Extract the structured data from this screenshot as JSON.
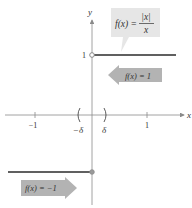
{
  "figure": {
    "function_label": {
      "lhs": "f(x) =",
      "numerator": "|x|",
      "denominator": "x"
    },
    "axes": {
      "x_label": "x",
      "y_label": "y"
    },
    "x_ticks": [
      {
        "label": "−1",
        "value": -1
      },
      {
        "label": "1",
        "value": 1
      }
    ],
    "y_ticks": [
      {
        "label": "1",
        "value": 1
      }
    ],
    "delta_labels": {
      "left": "−δ",
      "right": "δ"
    },
    "arrows": {
      "upper": {
        "text": "f(x) = 1",
        "direction": "left"
      },
      "lower": {
        "text": "f(x) = −1",
        "direction": "right"
      }
    },
    "colors": {
      "axis": "#8a8a8a",
      "graph": "#2b2b2b",
      "callout": "#e4e4e4",
      "arrow": "#b3b3b3",
      "point": "#8a8a8a"
    }
  }
}
